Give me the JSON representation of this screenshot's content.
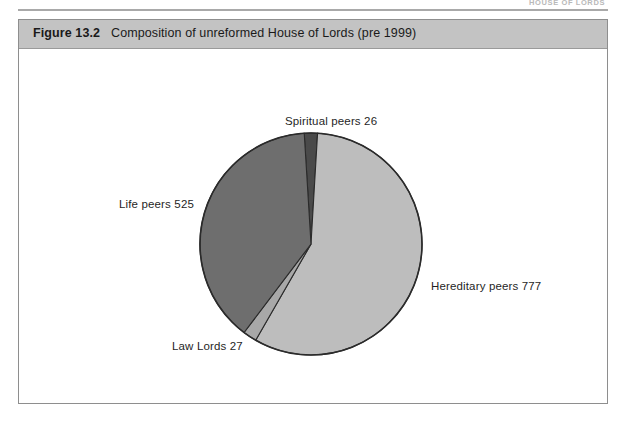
{
  "page": {
    "running_head": "HOUSE OF LORDS"
  },
  "figure": {
    "number": "Figure 13.2",
    "caption": "Composition of unreformed House of Lords (pre 1999)"
  },
  "chart_data": {
    "type": "pie",
    "title": "Composition of unreformed House of Lords (pre 1999)",
    "total": 1355,
    "categories": [
      "Spiritual peers",
      "Hereditary peers",
      "Law Lords",
      "Life peers"
    ],
    "values": [
      26,
      777,
      27,
      525
    ],
    "labels": [
      "Spiritual peers 26",
      "Hereditary peers 777",
      "Law Lords 27",
      "Life peers 525"
    ],
    "slices": [
      {
        "name": "Spiritual peers",
        "value": 26,
        "label": "Spiritual peers 26",
        "percent": 1.9,
        "color": "#4a4a4a",
        "start_angle": -3.5,
        "end_angle": 3.4
      },
      {
        "name": "Hereditary peers",
        "value": 777,
        "label": "Hereditary peers 777",
        "percent": 57.3,
        "color": "#bdbdbd",
        "start_angle": 3.4,
        "end_angle": 209.9
      },
      {
        "name": "Law Lords",
        "value": 27,
        "label": "Law Lords 27",
        "percent": 2.0,
        "color": "#a8a8a8",
        "start_angle": 209.9,
        "end_angle": 217.1
      },
      {
        "name": "Life peers",
        "value": 525,
        "label": "Life peers 525",
        "percent": 38.7,
        "color": "#6e6e6e",
        "start_angle": 217.1,
        "end_angle": 356.5
      }
    ],
    "legend": "none",
    "grid": false,
    "xlabel": "",
    "ylabel": "",
    "outline_color": "#2b2b2b",
    "header_color": "#c3c3c3"
  }
}
